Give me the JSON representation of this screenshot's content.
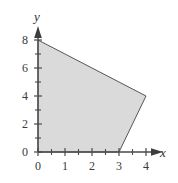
{
  "chart_data": {
    "type": "area",
    "title": "",
    "subtitle": "",
    "xlabel": "x",
    "ylabel": "y",
    "xlim": [
      0,
      4.6
    ],
    "ylim": [
      0,
      8.6
    ],
    "grid": false,
    "legend": null,
    "x_ticks_major": [
      0,
      1,
      2,
      3,
      4
    ],
    "x_tick_labels": [
      "0",
      "1",
      "2",
      "3",
      "4"
    ],
    "x_ticks_minor": [
      0.5,
      1.5,
      2.5,
      3.5
    ],
    "y_ticks_major": [
      0,
      2,
      4,
      6,
      8
    ],
    "y_tick_labels": [
      "0",
      "2",
      "4",
      "6",
      "8"
    ],
    "y_ticks_minor": [
      1,
      3,
      5,
      7
    ],
    "series": [
      {
        "name": "shaded-region",
        "type": "polygon",
        "closed": true,
        "vertices": [
          {
            "x": 0,
            "y": 0
          },
          {
            "x": 0,
            "y": 8
          },
          {
            "x": 4,
            "y": 4
          },
          {
            "x": 3,
            "y": 0
          }
        ],
        "fill_color": "#dadada",
        "edge_color": "#555555"
      }
    ],
    "annotations": [],
    "colors": {
      "background": "#ffffff",
      "axis": "#4a4a4a",
      "tick_text": "#3b3b3b",
      "region_fill": "#dadada",
      "region_edge": "#555555"
    }
  },
  "axes": {
    "x_axis_name": "x",
    "y_axis_name": "y"
  }
}
